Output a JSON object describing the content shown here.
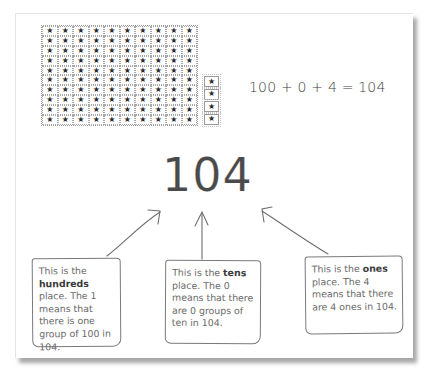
{
  "diagram": {
    "title_number": "104",
    "equation": "100 + 0 + 4 = 104",
    "blocks": {
      "hundreds_grid": {
        "rows": 10,
        "cols": 10,
        "symbol": "★",
        "count": 100
      },
      "ones_column": {
        "count": 4,
        "symbol": "★"
      }
    },
    "notes": [
      {
        "id": "hundreds",
        "prefix": "This is the ",
        "keyword": "hundreds",
        "suffix": " place. The 1 means that there is one group of 100 in 104."
      },
      {
        "id": "tens",
        "prefix": "This is the ",
        "keyword": "tens",
        "suffix": " place. The 0 means that there are 0 groups of ten in 104."
      },
      {
        "id": "ones",
        "prefix": "This is the ",
        "keyword": "ones",
        "suffix": " place. The 4 means that there are 4 ones in 104."
      }
    ],
    "colors": {
      "text": "#4a4a4a",
      "note_text": "#6a6a6a",
      "border": "#7a7a7a",
      "grid_border": "#a8a8a8"
    }
  }
}
